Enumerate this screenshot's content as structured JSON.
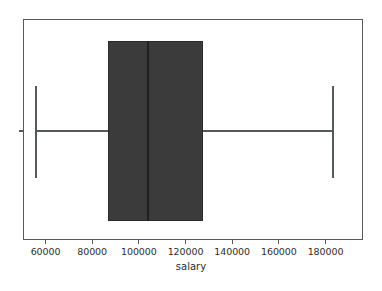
{
  "figure": {
    "background_color": "#ffffff",
    "axes_edge_color": "#555a5f",
    "box_fill_color": "#3b3b3b",
    "median_color": "#202020",
    "whisker_color": "#55595e"
  },
  "axis": {
    "xlabel": "salary",
    "ylabel": "",
    "title": "",
    "xticks": [
      "60000",
      "80000",
      "100000",
      "120000",
      "140000",
      "160000",
      "180000"
    ],
    "xtick_values": [
      60000,
      80000,
      100000,
      120000,
      140000,
      160000,
      180000
    ],
    "yticks": [
      ""
    ],
    "xlim": [
      50000,
      195000
    ],
    "grid": "off",
    "legend": "none"
  },
  "chart_data": {
    "type": "box",
    "orientation": "horizontal",
    "title": "",
    "xlabel": "salary",
    "ylabel": "",
    "categories": [
      "salary"
    ],
    "xlim": [
      50000,
      195000
    ],
    "grid": false,
    "legend_position": "none",
    "series": [
      {
        "name": "salary",
        "whisker_low": 56000,
        "q1": 86800,
        "median": 103900,
        "q3": 127500,
        "whisker_high": 183200,
        "outliers": []
      }
    ]
  }
}
